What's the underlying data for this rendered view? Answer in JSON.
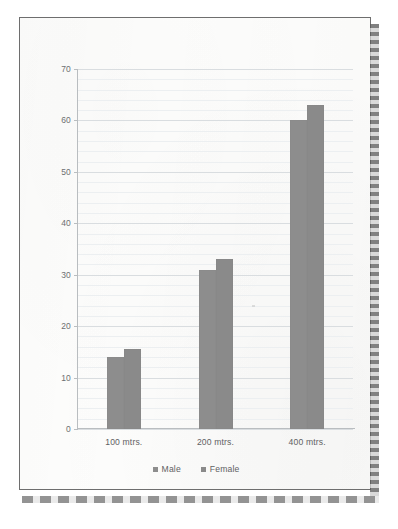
{
  "document": {
    "kind": "scanned-page-photo",
    "binding_right_name": "spiral-binding",
    "binding_bottom_name": "page-perforation"
  },
  "chart_data": {
    "type": "bar",
    "title": "",
    "subtitle": "",
    "xlabel": "",
    "ylabel": "",
    "categories": [
      "100 mtrs.",
      "200 mtrs.",
      "400 mtrs."
    ],
    "series": [
      {
        "name": "Male",
        "values": [
          14,
          31,
          60
        ],
        "color": "#8d8d8d"
      },
      {
        "name": "Female",
        "values": [
          15.5,
          33,
          63
        ],
        "color": "#8a8a8a"
      }
    ],
    "ylim": [
      0,
      70
    ],
    "y_ticks": [
      0,
      10,
      20,
      30,
      40,
      50,
      60,
      70
    ],
    "y_tick_labels": [
      "0",
      "10",
      "20",
      "30",
      "40",
      "50",
      "60",
      "70"
    ],
    "minor_tick_step": 2,
    "grid": true,
    "grid_axis": "y",
    "legend": [
      "Male",
      "Female"
    ],
    "legend_position": "bottom"
  },
  "colors": {
    "bar_male": "#8d8d8d",
    "bar_female": "#8a8a8a",
    "gridline_minor": "#eceff1",
    "gridline_major": "#d9dde0",
    "axis": "#b9bdc0",
    "tick_text": "#6d6f71",
    "label_text": "#5f6163",
    "page_border": "#6e6e6e",
    "page_background": "#fdfdfc"
  }
}
